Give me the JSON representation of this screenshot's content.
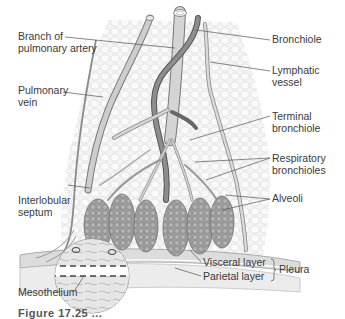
{
  "figure": {
    "labels": {
      "branch_pulmonary_artery": [
        "Branch of",
        "pulmonary artery"
      ],
      "pulmonary_vein": [
        "Pulmonary",
        "vein"
      ],
      "interlobular_septum": [
        "Interlobular",
        "septum"
      ],
      "mesothelium": "Mesothelium",
      "bronchiole": "Bronchiole",
      "lymphatic_vessel": [
        "Lymphatic",
        "vessel"
      ],
      "terminal_bronchiole": [
        "Terminal",
        "bronchiole"
      ],
      "respiratory_bronchioles": [
        "Respiratory",
        "bronchioles"
      ],
      "alveoli": "Alveoli",
      "visceral_layer": "Visceral layer",
      "parietal_layer": "Parietal layer",
      "pleura": "Pleura"
    },
    "caption_clipped": "Figure 17.25 ..."
  },
  "colors": {
    "label_text": "#3a3a3a",
    "leader_line": "#555555",
    "vessel_fill": "#c8c8c8",
    "vessel_stroke": "#777777",
    "alveoli_fill": "#a9a9a9",
    "lobule_bg": "#eeeeee",
    "pleura_fill": "#e2e2e2"
  }
}
